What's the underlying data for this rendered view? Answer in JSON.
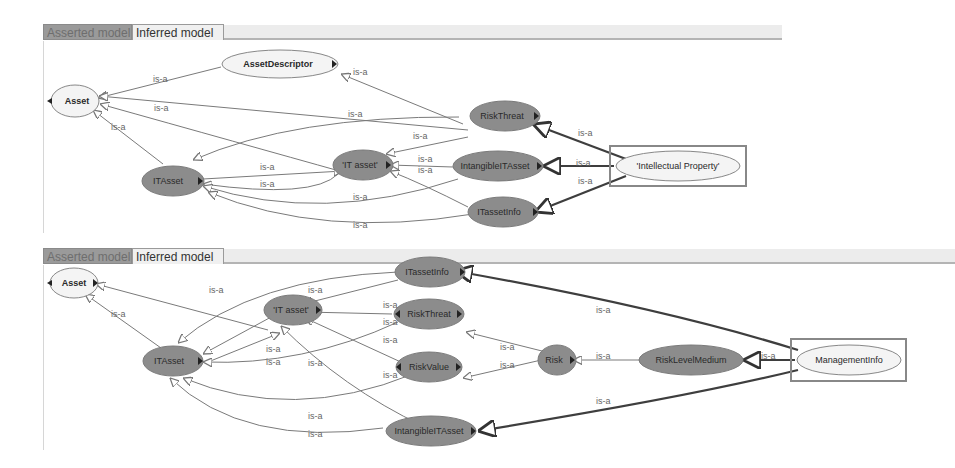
{
  "panels": [
    {
      "tabs": [
        {
          "label": "Asserted model",
          "active": false
        },
        {
          "label": "Inferred model",
          "active": true
        }
      ],
      "nodes": [
        {
          "id": "asset",
          "label": "Asset",
          "style": "light"
        },
        {
          "id": "assetdescriptor",
          "label": "AssetDescriptor",
          "style": "light"
        },
        {
          "id": "riskthreat",
          "label": "RiskThreat",
          "style": "dark"
        },
        {
          "id": "itasset",
          "label": "ITAsset",
          "style": "dark"
        },
        {
          "id": "itasset_q",
          "label": "'IT asset'",
          "style": "dark"
        },
        {
          "id": "intangibleitasset",
          "label": "IntangibleITAsset",
          "style": "dark"
        },
        {
          "id": "itassetinfo",
          "label": "ITassetInfo",
          "style": "dark"
        },
        {
          "id": "intellectual",
          "label": "'Intellectual Property'",
          "style": "light",
          "selected": true
        }
      ],
      "edge_label": "is-a"
    },
    {
      "tabs": [
        {
          "label": "Asserted model",
          "active": false
        },
        {
          "label": "Inferred model",
          "active": true
        }
      ],
      "nodes": [
        {
          "id": "asset",
          "label": "Asset",
          "style": "light"
        },
        {
          "id": "itassetinfo",
          "label": "ITassetInfo",
          "style": "dark"
        },
        {
          "id": "itasset_q",
          "label": "'IT asset'",
          "style": "dark"
        },
        {
          "id": "riskthreat",
          "label": "RiskThreat",
          "style": "dark"
        },
        {
          "id": "itasset",
          "label": "ITAsset",
          "style": "dark"
        },
        {
          "id": "riskvalue",
          "label": "RiskValue",
          "style": "dark"
        },
        {
          "id": "risk",
          "label": "Risk",
          "style": "dark"
        },
        {
          "id": "risklevelmedium",
          "label": "RiskLevelMedium",
          "style": "dark"
        },
        {
          "id": "managementinfo",
          "label": "ManagementInfo",
          "style": "light",
          "selected": true
        },
        {
          "id": "intangibleitasset",
          "label": "IntangibleITAsset",
          "style": "dark"
        }
      ],
      "edge_label": "is-a"
    }
  ],
  "colors": {
    "dark_node": "#8c8c8c",
    "light_node": "#f4f4f4",
    "edge": "#7a7a7a",
    "edge_bold": "#444444",
    "selection_box": "#888888"
  }
}
